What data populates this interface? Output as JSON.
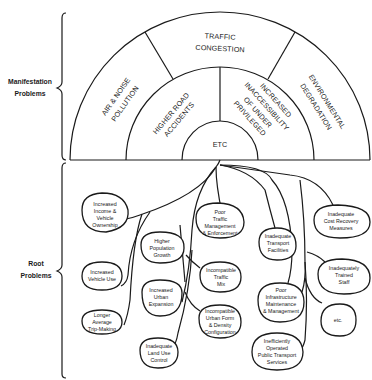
{
  "side_labels": {
    "manifestation": [
      "Manifestation",
      "Problems"
    ],
    "root": [
      "Root",
      "Problems"
    ]
  },
  "manifestation_problems": {
    "outer_ring": {
      "left": [
        "AIR & NOISE",
        "POLLUTION"
      ],
      "top": [
        "TRAFFIC",
        "CONGESTION"
      ],
      "right": [
        "ENVIRONMENTAL",
        "DEGRADATION"
      ]
    },
    "middle_ring": {
      "left": [
        "HIGHER ROAD",
        "ACCIDENTS"
      ],
      "right": [
        "INCREASED",
        "INACCESSIBILITY",
        "OF UNDER",
        "PRIVILEGED"
      ]
    },
    "center": "ETC"
  },
  "root_problems": [
    {
      "id": "income",
      "lines": [
        "Increased",
        "Income &",
        "Vehicle",
        "Ownership"
      ]
    },
    {
      "id": "vehicle-use",
      "lines": [
        "Increased",
        "Vehicle Use"
      ]
    },
    {
      "id": "trip-making",
      "lines": [
        "Longer",
        "Average",
        "Trip-Making"
      ]
    },
    {
      "id": "population",
      "lines": [
        "Higher",
        "Population",
        "Growth"
      ]
    },
    {
      "id": "urban-expansion",
      "lines": [
        "Increased",
        "Urban",
        "Expansion"
      ]
    },
    {
      "id": "land-use",
      "lines": [
        "Inadequate",
        "Land Use",
        "Control"
      ]
    },
    {
      "id": "traffic-mgmt",
      "lines": [
        "Poor",
        "Traffic",
        "Management",
        "& Enforcement"
      ]
    },
    {
      "id": "traffic-mix",
      "lines": [
        "Incompatible",
        "Traffic",
        "Mix"
      ]
    },
    {
      "id": "urban-form",
      "lines": [
        "Incompatible",
        "Urban Form",
        "& Density",
        "Configuration"
      ]
    },
    {
      "id": "transport-facilities",
      "lines": [
        "Inadequate",
        "Transport",
        "Facilities"
      ]
    },
    {
      "id": "infrastructure",
      "lines": [
        "Poor",
        "Infrastructure",
        "Maintenance",
        "& Management"
      ]
    },
    {
      "id": "public-transport",
      "lines": [
        "Inefficiently",
        "Operated",
        "Public Transport",
        "Services"
      ]
    },
    {
      "id": "cost-recovery",
      "lines": [
        "Inadequate",
        "Cost Recovery",
        "Measures"
      ]
    },
    {
      "id": "trained-staff",
      "lines": [
        "Inadequately",
        "Trained",
        "Staff"
      ]
    },
    {
      "id": "etc",
      "lines": [
        "etc."
      ]
    }
  ]
}
